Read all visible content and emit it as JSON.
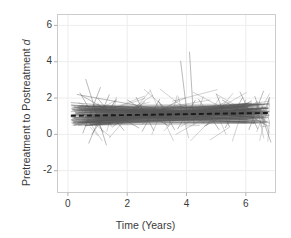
{
  "chart_data": {
    "type": "line",
    "title": "",
    "subtitle": "",
    "xlabel": "Time (Years)",
    "ylabel_prefix": "Pretreatment to Postreatment ",
    "ylabel_symbol": "d",
    "xlim": [
      -0.35,
      7.0
    ],
    "ylim": [
      -3.2,
      6.6
    ],
    "xticks": [
      0,
      2,
      4,
      6
    ],
    "xticklabels": [
      "0",
      "2",
      "4",
      "6"
    ],
    "yticks": [
      -2,
      0,
      2,
      4,
      6
    ],
    "yticklabels": [
      "-2",
      "0",
      "2",
      "4",
      "6"
    ],
    "grid": true,
    "legend": "none",
    "line_color": "#555555",
    "trend_color": "#1a1a1a",
    "frame_color": "#cccccc",
    "grid_color": "#ededed",
    "background": "#ffffff",
    "trend_line": {
      "name": "Average trend",
      "style": "dashed",
      "x": [
        0.1,
        6.8
      ],
      "y": [
        1.02,
        1.18
      ]
    },
    "series": [
      {
        "name": "s1",
        "x": [
          0.12,
          6.75
        ],
        "y": [
          1.05,
          1.22
        ]
      },
      {
        "name": "s2",
        "x": [
          0.15,
          6.7
        ],
        "y": [
          1.35,
          1.1
        ]
      },
      {
        "name": "s3",
        "x": [
          0.1,
          6.6
        ],
        "y": [
          0.8,
          1.3
        ]
      },
      {
        "name": "s4",
        "x": [
          0.2,
          6.5
        ],
        "y": [
          1.5,
          1.05
        ]
      },
      {
        "name": "s5",
        "x": [
          0.1,
          6.8
        ],
        "y": [
          0.95,
          1.25
        ]
      },
      {
        "name": "s6",
        "x": [
          0.25,
          6.4
        ],
        "y": [
          1.2,
          1.35
        ]
      },
      {
        "name": "s7",
        "x": [
          0.12,
          6.7
        ],
        "y": [
          1.6,
          0.95
        ]
      },
      {
        "name": "s8",
        "x": [
          0.18,
          6.55
        ],
        "y": [
          0.7,
          1.4
        ]
      },
      {
        "name": "s9",
        "x": [
          0.1,
          6.65
        ],
        "y": [
          1.1,
          1.15
        ]
      },
      {
        "name": "s10",
        "x": [
          0.3,
          6.3
        ],
        "y": [
          1.45,
          1.0
        ]
      },
      {
        "name": "s11",
        "x": [
          0.14,
          6.75
        ],
        "y": [
          0.85,
          1.45
        ]
      },
      {
        "name": "s12",
        "x": [
          0.22,
          6.45
        ],
        "y": [
          1.3,
          1.2
        ]
      },
      {
        "name": "s13",
        "x": [
          0.1,
          6.6
        ],
        "y": [
          1.75,
          0.9
        ]
      },
      {
        "name": "s14",
        "x": [
          0.16,
          6.7
        ],
        "y": [
          0.6,
          1.5
        ]
      },
      {
        "name": "s15",
        "x": [
          0.28,
          6.35
        ],
        "y": [
          1.15,
          1.28
        ]
      },
      {
        "name": "s16",
        "x": [
          0.12,
          6.8
        ],
        "y": [
          1.4,
          1.05
        ]
      },
      {
        "name": "s17",
        "x": [
          0.2,
          6.5
        ],
        "y": [
          0.9,
          1.35
        ]
      },
      {
        "name": "s18",
        "x": [
          0.1,
          6.65
        ],
        "y": [
          1.25,
          1.18
        ]
      },
      {
        "name": "s19",
        "x": [
          0.35,
          6.25
        ],
        "y": [
          1.55,
          0.95
        ]
      },
      {
        "name": "s20",
        "x": [
          0.14,
          6.72
        ],
        "y": [
          0.75,
          1.42
        ]
      },
      {
        "name": "s21",
        "x": [
          0.24,
          6.48
        ],
        "y": [
          1.18,
          1.3
        ]
      },
      {
        "name": "s22",
        "x": [
          0.1,
          6.58
        ],
        "y": [
          1.62,
          0.88
        ]
      },
      {
        "name": "s23",
        "x": [
          0.18,
          6.68
        ],
        "y": [
          0.65,
          1.48
        ]
      },
      {
        "name": "s24",
        "x": [
          0.3,
          6.38
        ],
        "y": [
          1.32,
          1.12
        ]
      },
      {
        "name": "s25",
        "x": [
          0.12,
          6.78
        ],
        "y": [
          1.08,
          1.26
        ]
      },
      {
        "name": "s26",
        "x": [
          0.4,
          1.2
        ],
        "y": [
          2.3,
          0.1
        ]
      },
      {
        "name": "s27",
        "x": [
          0.5,
          1.1
        ],
        "y": [
          0.05,
          2.6
        ]
      },
      {
        "name": "s28",
        "x": [
          0.6,
          1.3
        ],
        "y": [
          3.05,
          -0.6
        ]
      },
      {
        "name": "s29",
        "x": [
          0.7,
          1.4
        ],
        "y": [
          -0.5,
          2.2
        ]
      },
      {
        "name": "s30",
        "x": [
          0.45,
          2.4
        ],
        "y": [
          2.15,
          0.35
        ]
      },
      {
        "name": "s31",
        "x": [
          2.3,
          2.9
        ],
        "y": [
          2.05,
          0.2
        ]
      },
      {
        "name": "s32",
        "x": [
          2.5,
          3.1
        ],
        "y": [
          0.15,
          1.95
        ]
      },
      {
        "name": "s33",
        "x": [
          3.05,
          3.6
        ],
        "y": [
          1.85,
          0.25
        ]
      },
      {
        "name": "s34",
        "x": [
          3.8,
          4.05
        ],
        "y": [
          4.05,
          0.7
        ]
      },
      {
        "name": "s35",
        "x": [
          4.1,
          4.25
        ],
        "y": [
          4.55,
          0.55
        ]
      },
      {
        "name": "s36",
        "x": [
          3.7,
          4.3
        ],
        "y": [
          0.3,
          1.9
        ]
      },
      {
        "name": "s37",
        "x": [
          4.4,
          5.1
        ],
        "y": [
          1.95,
          0.25
        ]
      },
      {
        "name": "s38",
        "x": [
          5.0,
          5.45
        ],
        "y": [
          2.25,
          0.4
        ]
      },
      {
        "name": "s39",
        "x": [
          5.3,
          5.9
        ],
        "y": [
          0.35,
          2.05
        ]
      },
      {
        "name": "s40",
        "x": [
          5.8,
          6.4
        ],
        "y": [
          2.35,
          0.3
        ]
      },
      {
        "name": "s41",
        "x": [
          6.1,
          6.6
        ],
        "y": [
          0.25,
          2.4
        ]
      },
      {
        "name": "s42",
        "x": [
          6.3,
          6.85
        ],
        "y": [
          2.1,
          -0.45
        ]
      },
      {
        "name": "s43",
        "x": [
          0.8,
          1.6
        ],
        "y": [
          0.0,
          1.85
        ]
      },
      {
        "name": "s44",
        "x": [
          1.0,
          1.9
        ],
        "y": [
          2.0,
          0.2
        ]
      },
      {
        "name": "s45",
        "x": [
          1.5,
          2.6
        ],
        "y": [
          0.4,
          1.8
        ]
      },
      {
        "name": "s46",
        "x": [
          2.0,
          3.4
        ],
        "y": [
          1.9,
          0.45
        ]
      },
      {
        "name": "s47",
        "x": [
          0.3,
          3.0
        ],
        "y": [
          2.2,
          1.4
        ]
      },
      {
        "name": "s48",
        "x": [
          0.2,
          4.0
        ],
        "y": [
          0.5,
          1.6
        ]
      },
      {
        "name": "s49",
        "x": [
          4.6,
          6.2
        ],
        "y": [
          0.45,
          1.85
        ]
      },
      {
        "name": "s50",
        "x": [
          5.2,
          6.7
        ],
        "y": [
          1.9,
          0.5
        ]
      }
    ]
  }
}
